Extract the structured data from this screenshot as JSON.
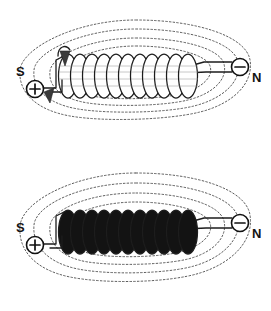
{
  "figure": {
    "background_color": "#ffffff",
    "ink_color": "#131313",
    "fieldline_color": "#4a4a4a",
    "core_fill_color": "#131313",
    "panel_count": 2
  },
  "panels": [
    {
      "id": "air-core-solenoid",
      "label": "top",
      "core_type": "air",
      "coil_fill": "open",
      "turns": 11,
      "has_current_arrows": true,
      "field_loop_count": 4,
      "south_label": "S",
      "north_label": "N",
      "positive_terminal": "+",
      "negative_terminal": "−"
    },
    {
      "id": "iron-core-solenoid",
      "label": "bottom",
      "core_type": "iron",
      "coil_fill": "solid",
      "turns": 11,
      "has_current_arrows": false,
      "field_loop_count": 4,
      "south_label": "S",
      "north_label": "N",
      "positive_terminal": "+",
      "negative_terminal": "−"
    }
  ],
  "labels": {
    "south": "S",
    "north": "N",
    "plus": "+",
    "minus": "−"
  }
}
